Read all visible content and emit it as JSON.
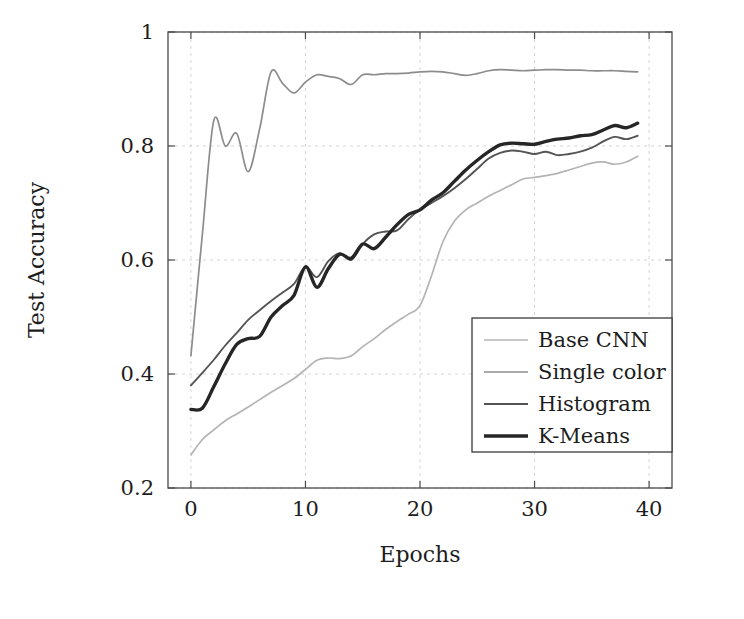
{
  "chart_data": {
    "type": "line",
    "title": "",
    "xlabel": "Epochs",
    "ylabel": "Test Accuracy",
    "xlim": [
      -2,
      42
    ],
    "ylim": [
      0.2,
      1.0
    ],
    "xticks": [
      0,
      10,
      20,
      30,
      40
    ],
    "xtick_labels": [
      "0",
      "10",
      "20",
      "30",
      "40"
    ],
    "yticks": [
      0.2,
      0.4,
      0.6,
      0.8,
      1.0
    ],
    "ytick_labels": [
      "0.2",
      "0.4",
      "0.6",
      "0.8",
      "1"
    ],
    "grid": true,
    "legend_position": "lower right",
    "x": [
      0,
      1,
      2,
      3,
      4,
      5,
      6,
      7,
      8,
      9,
      10,
      11,
      12,
      13,
      14,
      15,
      16,
      17,
      18,
      19,
      20,
      21,
      22,
      23,
      24,
      25,
      26,
      27,
      28,
      29,
      30,
      31,
      32,
      33,
      34,
      35,
      36,
      37,
      38,
      39
    ],
    "series": [
      {
        "name": "Base CNN",
        "color": "#b4b4b4",
        "width": 1.7,
        "values": [
          0.258,
          0.285,
          0.302,
          0.318,
          0.33,
          0.342,
          0.355,
          0.368,
          0.38,
          0.392,
          0.408,
          0.424,
          0.428,
          0.427,
          0.432,
          0.448,
          0.462,
          0.478,
          0.492,
          0.505,
          0.52,
          0.572,
          0.632,
          0.668,
          0.688,
          0.7,
          0.712,
          0.722,
          0.732,
          0.742,
          0.745,
          0.748,
          0.752,
          0.758,
          0.764,
          0.77,
          0.772,
          0.768,
          0.772,
          0.782
        ]
      },
      {
        "name": "Single color",
        "color": "#8c8c8c",
        "width": 1.7,
        "values": [
          0.432,
          0.645,
          0.845,
          0.8,
          0.822,
          0.755,
          0.83,
          0.93,
          0.91,
          0.893,
          0.912,
          0.925,
          0.922,
          0.918,
          0.908,
          0.925,
          0.925,
          0.927,
          0.927,
          0.928,
          0.93,
          0.931,
          0.93,
          0.927,
          0.924,
          0.927,
          0.932,
          0.934,
          0.933,
          0.932,
          0.933,
          0.934,
          0.934,
          0.933,
          0.933,
          0.932,
          0.932,
          0.932,
          0.931,
          0.93
        ]
      },
      {
        "name": "Histogram",
        "color": "#545454",
        "width": 1.9,
        "values": [
          0.38,
          0.402,
          0.425,
          0.45,
          0.472,
          0.495,
          0.512,
          0.528,
          0.543,
          0.558,
          0.588,
          0.57,
          0.598,
          0.612,
          0.6,
          0.628,
          0.645,
          0.65,
          0.652,
          0.672,
          0.688,
          0.7,
          0.712,
          0.726,
          0.742,
          0.76,
          0.778,
          0.788,
          0.792,
          0.79,
          0.786,
          0.79,
          0.784,
          0.786,
          0.79,
          0.797,
          0.808,
          0.816,
          0.812,
          0.818
        ]
      },
      {
        "name": "K-Means",
        "color": "#262626",
        "width": 3.4,
        "values": [
          0.338,
          0.34,
          0.378,
          0.418,
          0.452,
          0.462,
          0.466,
          0.5,
          0.52,
          0.538,
          0.588,
          0.552,
          0.585,
          0.61,
          0.603,
          0.628,
          0.62,
          0.64,
          0.662,
          0.68,
          0.688,
          0.705,
          0.718,
          0.738,
          0.758,
          0.775,
          0.79,
          0.802,
          0.805,
          0.804,
          0.803,
          0.808,
          0.812,
          0.814,
          0.818,
          0.82,
          0.828,
          0.836,
          0.832,
          0.84
        ]
      }
    ]
  },
  "legend": {
    "items": [
      {
        "label": "Base CNN"
      },
      {
        "label": "Single color"
      },
      {
        "label": "Histogram"
      },
      {
        "label": "K-Means"
      }
    ]
  }
}
